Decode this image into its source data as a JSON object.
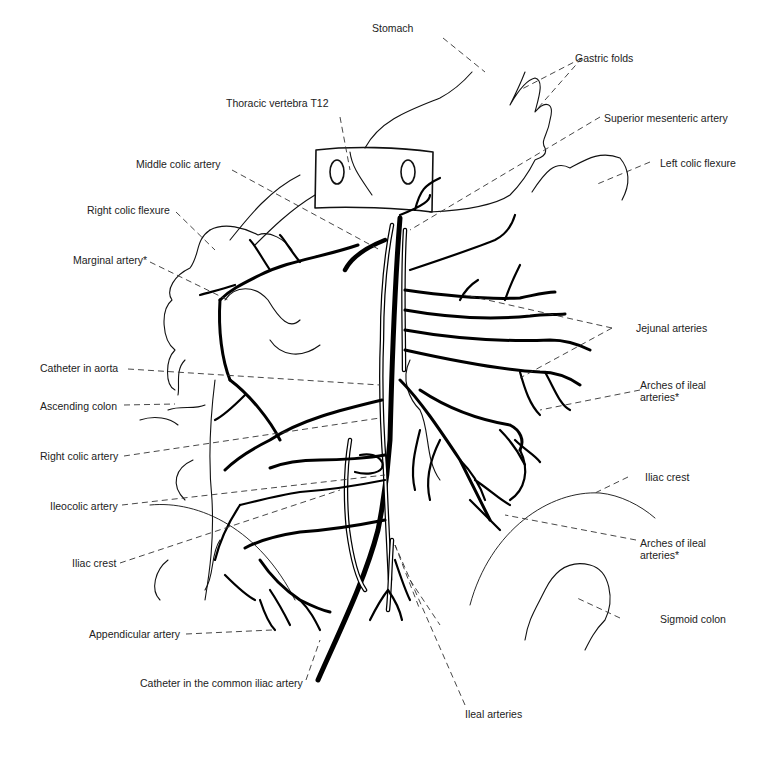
{
  "figure": {
    "type": "anatomical-line-drawing"
  },
  "labels": {
    "stomach": "Stomach",
    "gastric_folds": "Gastric folds",
    "thoracic_vertebra": "Thoracic vertebra T12",
    "superior_mesenteric_artery": "Superior mesenteric artery",
    "middle_colic_artery": "Middle colic artery",
    "left_colic_flexure": "Left colic flexure",
    "right_colic_flexure": "Right colic flexure",
    "marginal_artery": "Marginal artery*",
    "jejunal_arteries": "Jejunal arteries",
    "catheter_in_aorta": "Catheter in aorta",
    "arches_of_ileal_arteries_1": "Arches of ileal arteries*",
    "ascending_colon": "Ascending colon",
    "right_colic_artery": "Right colic artery",
    "iliac_crest_right": "Iliac crest",
    "ileocolic_artery": "Ileocolic artery",
    "arches_of_ileal_arteries_2": "Arches of ileal arteries*",
    "iliac_crest_left": "Iliac crest",
    "sigmoid_colon": "Sigmoid colon",
    "appendicular_artery": "Appendicular artery",
    "catheter_common_iliac": "Catheter in the common iliac artery",
    "ileal_arteries": "Ileal arteries"
  },
  "labels_split": {
    "arches_1_line1": "Arches of ileal",
    "arches_1_line2": "arteries*",
    "arches_2_line1": "Arches of ileal",
    "arches_2_line2": "arteries*"
  }
}
